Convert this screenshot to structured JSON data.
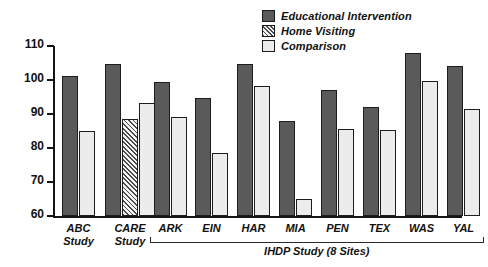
{
  "chart_data": {
    "type": "bar",
    "title": "",
    "xlabel": "",
    "ylabel": "",
    "ylim": [
      60,
      110
    ],
    "yticks": [
      60,
      70,
      80,
      90,
      100,
      110
    ],
    "grid": false,
    "legend_position": "top-right",
    "legend": [
      {
        "name": "Educational Intervention",
        "key": "edu",
        "color": "#5a5a5a",
        "pattern": "solid"
      },
      {
        "name": "Home Visiting",
        "key": "home",
        "color": "#4a4a4a",
        "pattern": "diagonal-hatch"
      },
      {
        "name": "Comparison",
        "key": "comp",
        "color": "#ececec",
        "pattern": "solid"
      }
    ],
    "categories": [
      "ABC\nStudy",
      "CARE\nStudy",
      "ARK",
      "EIN",
      "HAR",
      "MIA",
      "PEN",
      "TEX",
      "WAS",
      "YAL"
    ],
    "series": [
      {
        "name": "Educational Intervention",
        "values": [
          101.2,
          104.8,
          99.5,
          94.8,
          104.8,
          88.0,
          97.0,
          92.0,
          108.0,
          104.2
        ]
      },
      {
        "name": "Home Visiting",
        "values": [
          null,
          88.6,
          null,
          null,
          null,
          null,
          null,
          null,
          null,
          null
        ]
      },
      {
        "name": "Comparison",
        "values": [
          85.0,
          93.3,
          89.0,
          78.6,
          98.3,
          65.0,
          85.6,
          85.2,
          99.6,
          91.5
        ]
      }
    ],
    "annotations": [
      {
        "text": "IHDP Study (8 Sites)",
        "spans_categories": [
          "ARK",
          "EIN",
          "HAR",
          "MIA",
          "PEN",
          "TEX",
          "WAS",
          "YAL"
        ]
      }
    ]
  },
  "axis": {
    "tick_labels": [
      "110",
      "100",
      "90",
      "80",
      "70",
      "60"
    ]
  },
  "legend": {
    "items": [
      {
        "label": "Educational Intervention"
      },
      {
        "label": "Home Visiting"
      },
      {
        "label": "Comparison"
      }
    ]
  },
  "bracket": {
    "label": "IHDP Study (8 Sites)"
  },
  "colors": {
    "educational": "#5a5a5a",
    "home_visiting": "#4a4a4a",
    "comparison": "#ececec",
    "axis": "#141414",
    "text": "#111111"
  }
}
